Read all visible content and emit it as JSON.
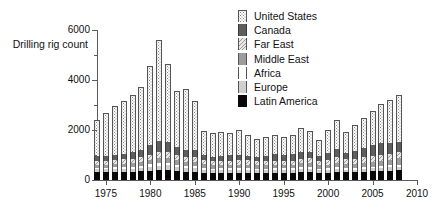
{
  "chart_data": {
    "type": "bar",
    "subtype": "stacked-bar",
    "title": "",
    "xlabel": "",
    "ylabel": "Drilling rig count",
    "ylim": [
      0,
      6000
    ],
    "xlim": [
      1974,
      2010
    ],
    "ytick_labels": [
      "0",
      "2000",
      "4000",
      "6000"
    ],
    "ytick_values": [
      0,
      2000,
      4000,
      6000
    ],
    "yminor_ticks": [
      1000,
      3000,
      5000
    ],
    "xtick_labels": [
      "1975",
      "1980",
      "1985",
      "1990",
      "1995",
      "2000",
      "2005",
      "2010"
    ],
    "xtick_values": [
      1975,
      1980,
      1985,
      1990,
      1995,
      2000,
      2005,
      2010
    ],
    "grid": false,
    "legend_position": "top-right",
    "legend_entries": [
      {
        "name": "United States",
        "swatch": "dotted-white"
      },
      {
        "name": "Canada",
        "swatch": "dark-gray"
      },
      {
        "name": "Far East",
        "swatch": "hatched-light"
      },
      {
        "name": "Middle East",
        "swatch": "medium-gray"
      },
      {
        "name": "Africa",
        "swatch": "white"
      },
      {
        "name": "Europe",
        "swatch": "light-gray"
      },
      {
        "name": "Latin America",
        "swatch": "black"
      }
    ],
    "categories": [
      1974,
      1975,
      1976,
      1977,
      1978,
      1979,
      1980,
      1981,
      1982,
      1983,
      1984,
      1985,
      1986,
      1987,
      1988,
      1989,
      1990,
      1991,
      1992,
      1993,
      1994,
      1995,
      1996,
      1997,
      1998,
      1999,
      2000,
      2001,
      2002,
      2003,
      2004,
      2005,
      2006,
      2007,
      2008
    ],
    "series": [
      {
        "name": "Latin America",
        "values": [
          330,
          330,
          330,
          330,
          330,
          350,
          380,
          400,
          400,
          350,
          330,
          320,
          290,
          280,
          290,
          290,
          300,
          300,
          290,
          290,
          300,
          300,
          300,
          330,
          330,
          280,
          300,
          340,
          310,
          310,
          330,
          350,
          360,
          370,
          390
        ]
      },
      {
        "name": "Europe",
        "values": [
          110,
          110,
          120,
          120,
          130,
          140,
          160,
          180,
          190,
          160,
          150,
          150,
          130,
          120,
          120,
          120,
          120,
          120,
          110,
          110,
          110,
          110,
          110,
          120,
          120,
          110,
          110,
          120,
          110,
          110,
          120,
          120,
          130,
          140,
          140
        ]
      },
      {
        "name": "Africa",
        "values": [
          60,
          60,
          60,
          70,
          70,
          80,
          90,
          100,
          100,
          90,
          80,
          80,
          70,
          60,
          60,
          60,
          60,
          60,
          60,
          60,
          60,
          60,
          60,
          70,
          70,
          60,
          60,
          70,
          60,
          60,
          70,
          70,
          80,
          80,
          90
        ]
      },
      {
        "name": "Middle East",
        "values": [
          120,
          120,
          130,
          140,
          150,
          160,
          180,
          200,
          210,
          190,
          170,
          170,
          150,
          140,
          140,
          140,
          140,
          140,
          130,
          130,
          130,
          140,
          140,
          150,
          160,
          140,
          150,
          170,
          160,
          160,
          180,
          190,
          210,
          230,
          250
        ]
      },
      {
        "name": "Far East",
        "values": [
          150,
          150,
          160,
          170,
          180,
          190,
          210,
          230,
          240,
          220,
          200,
          200,
          180,
          170,
          170,
          170,
          170,
          170,
          160,
          160,
          170,
          170,
          170,
          190,
          200,
          180,
          190,
          210,
          200,
          200,
          210,
          220,
          230,
          240,
          250
        ]
      },
      {
        "name": "Canada",
        "values": [
          180,
          190,
          210,
          230,
          250,
          300,
          380,
          450,
          400,
          320,
          290,
          280,
          180,
          170,
          200,
          230,
          200,
          170,
          190,
          220,
          260,
          240,
          250,
          280,
          260,
          200,
          270,
          330,
          260,
          330,
          370,
          450,
          470,
          430,
          410
        ]
      },
      {
        "name": "United States",
        "values": [
          1450,
          1710,
          1950,
          2100,
          2280,
          2520,
          3150,
          4040,
          3100,
          2230,
          2430,
          1980,
          960,
          940,
          930,
          870,
          1010,
          860,
          720,
          750,
          780,
          720,
          780,
          950,
          830,
          620,
          920,
          1160,
          830,
          1030,
          1190,
          1380,
          1560,
          1700,
          1880
        ]
      }
    ],
    "totals": [
      2400,
      2670,
      2960,
      3160,
      3390,
      3740,
      4550,
      5600,
      4640,
      3560,
      3650,
      3180,
      1960,
      1880,
      1910,
      1880,
      2000,
      1820,
      1660,
      1720,
      1810,
      1740,
      1810,
      2090,
      1970,
      1590,
      2000,
      2400,
      1930,
      2200,
      2470,
      2780,
      3040,
      3190,
      3410
    ]
  }
}
